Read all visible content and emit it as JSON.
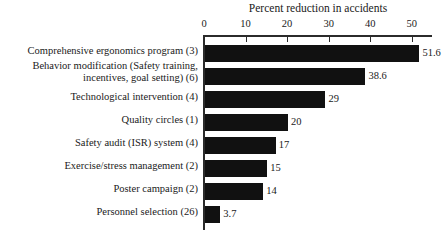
{
  "chart_data": {
    "type": "bar",
    "orientation": "horizontal",
    "title": "Percent reduction in accidents",
    "xlabel": "",
    "ylabel": "",
    "xlim": [
      0,
      55
    ],
    "grid": false,
    "legend": null,
    "tick_labels": [
      "0",
      "10",
      "20",
      "30",
      "40",
      "50"
    ],
    "ticks": [
      0,
      10,
      20,
      30,
      40,
      50
    ],
    "categories": [
      "Comprehensive ergonomics program (3)",
      "Behavior modification (Safety training, incentives, goal setting) (6)",
      "Technological intervention (4)",
      "Quality circles (1)",
      "Safety audit (ISR) system (4)",
      "Exercise/stress management (2)",
      "Poster campaign (2)",
      "Personnel selection (26)"
    ],
    "values": [
      51.6,
      38.6,
      29,
      20,
      17,
      15,
      14,
      3.7
    ],
    "value_labels": [
      "51.6",
      "38.6",
      "29",
      "20",
      "17",
      "15",
      "14",
      "3.7"
    ],
    "bar_color": "#111111",
    "axis_color": "#2b2b2b",
    "text_color": "#1a1a1a",
    "background_color": "#ffffff"
  },
  "categories_lines": [
    [
      "Comprehensive ergonomics program (3)"
    ],
    [
      "Behavior modification (Safety training,",
      "incentives, goal setting) (6)"
    ],
    [
      "Technological intervention (4)"
    ],
    [
      "Quality circles (1)"
    ],
    [
      "Safety audit (ISR) system (4)"
    ],
    [
      "Exercise/stress management (2)"
    ],
    [
      "Poster campaign (2)"
    ],
    [
      "Personnel selection (26)"
    ]
  ]
}
